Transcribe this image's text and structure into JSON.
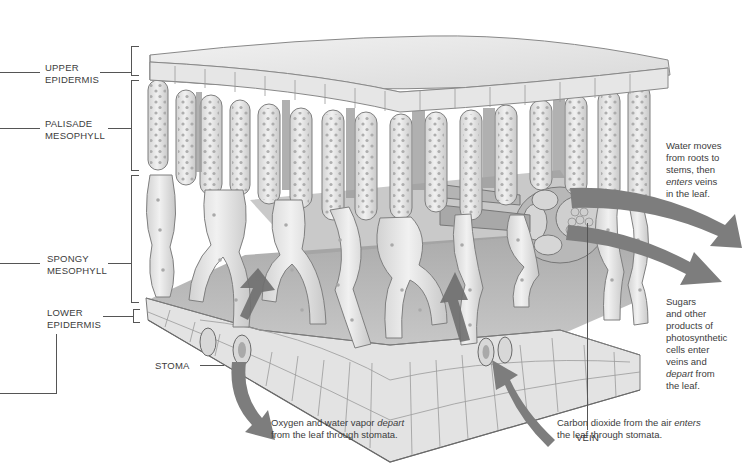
{
  "diagram": {
    "layer_labels": [
      {
        "id": "upper-epidermis",
        "line1": "UPPER",
        "line2": "EPIDERMIS"
      },
      {
        "id": "palisade-mesophyll",
        "line1": "PALISADE",
        "line2": "MESOPHYLL"
      },
      {
        "id": "spongy-mesophyll",
        "line1": "SPONGY",
        "line2": "MESOPHYLL"
      },
      {
        "id": "lower-epidermis",
        "line1": "LOWER",
        "line2": "EPIDERMIS"
      }
    ],
    "structure_labels": {
      "stoma": "STOMA",
      "vein": "VEIN"
    },
    "annotations": {
      "water": {
        "lines": [
          "Water moves",
          "from roots to",
          "stems, then"
        ],
        "em": "enters",
        "after_em": " veins",
        "last": "in the leaf."
      },
      "sugars": {
        "lines": [
          "Sugars",
          "and other",
          "products of",
          "photosynthetic",
          "cells enter",
          "veins and"
        ],
        "em": "depart",
        "after_em": " from",
        "last": "the leaf."
      },
      "oxygen": {
        "before_em": "Oxygen and water vapor ",
        "em": "depart",
        "line2": "from the leaf through stomata."
      },
      "carbon": {
        "before_em": "Carbon dioxide from the air ",
        "em": "enters",
        "line2": "the leaf through stomata."
      }
    },
    "colors": {
      "cell_fill": "#e4e4e4",
      "cell_stroke": "#8a8a8a",
      "chloroplast": "#a9a9a9",
      "shadow": "#9a9a9a",
      "arrow": "#7d7d7d",
      "text": "#3c3c3c"
    }
  }
}
